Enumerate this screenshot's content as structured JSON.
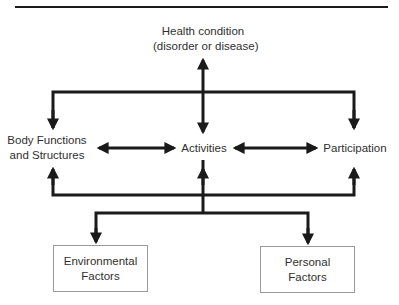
{
  "diagram": {
    "nodes": {
      "health_condition": {
        "line1": "Health condition",
        "line2": "(disorder or disease)"
      },
      "body_functions": {
        "line1": "Body Functions",
        "line2": "and Structures"
      },
      "activities": {
        "label": "Activities"
      },
      "participation": {
        "label": "Participation"
      },
      "environmental": {
        "line1": "Environmental",
        "line2": "Factors"
      },
      "personal": {
        "line1": "Personal",
        "line2": "Factors"
      }
    },
    "edges": [
      {
        "from": "health_condition",
        "to": "activities",
        "type": "bidirectional"
      },
      {
        "from": "health_condition",
        "to": "body_functions",
        "type": "directed"
      },
      {
        "from": "health_condition",
        "to": "participation",
        "type": "directed"
      },
      {
        "from": "body_functions",
        "to": "activities",
        "type": "bidirectional"
      },
      {
        "from": "activities",
        "to": "participation",
        "type": "bidirectional"
      },
      {
        "from": "activities",
        "to": "environmental",
        "type": "directed"
      },
      {
        "from": "activities",
        "to": "personal",
        "type": "directed"
      },
      {
        "from": "contextual",
        "to": "body_functions",
        "type": "directed"
      },
      {
        "from": "contextual",
        "to": "participation",
        "type": "directed"
      }
    ],
    "colors": {
      "line": "#1a1a1a",
      "text": "#2f2f2f",
      "box_border": "#9a9a9a"
    }
  }
}
